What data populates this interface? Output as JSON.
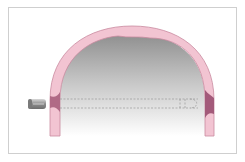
{
  "diagram": {
    "elements": [
      {
        "name": "projectile",
        "description": "bullet approaching from left"
      },
      {
        "name": "entry-wound",
        "side": "left"
      },
      {
        "name": "exit-wound",
        "side": "right"
      },
      {
        "name": "trajectory",
        "style": "dashed"
      }
    ],
    "colors": {
      "bone": "#f2c4d2",
      "bone_edge": "#c98aa0",
      "wound": "#b06a86",
      "cavity_top": "#9a9a9a",
      "cavity_bottom": "#ffffff",
      "frame": "#cfcfcf",
      "bullet": "#a9a9a9"
    }
  }
}
